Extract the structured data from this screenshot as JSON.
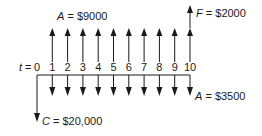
{
  "diagram": {
    "type": "cash-flow-diagram",
    "time_label": "t =",
    "periods": [
      "0",
      "1",
      "2",
      "3",
      "4",
      "5",
      "6",
      "7",
      "8",
      "9",
      "10"
    ],
    "labels": {
      "receipts": {
        "var": "A",
        "text": " = $9000"
      },
      "future": {
        "var": "F",
        "text": " = $2000"
      },
      "costs": {
        "var": "A",
        "text": " = $3500"
      },
      "initial": {
        "var": "C",
        "text": " = $20,000"
      }
    },
    "flows": {
      "initial_cost": {
        "period": 0,
        "amount": 20000,
        "direction": "out"
      },
      "annual_receipts": {
        "periods": [
          1,
          10
        ],
        "amount": 9000,
        "direction": "in"
      },
      "annual_costs": {
        "periods": [
          1,
          10
        ],
        "amount": 3500,
        "direction": "out"
      },
      "salvage": {
        "period": 10,
        "amount": 2000,
        "direction": "in"
      }
    },
    "colors": {
      "ink": "#1a1a1a",
      "background": "#ffffff"
    }
  }
}
